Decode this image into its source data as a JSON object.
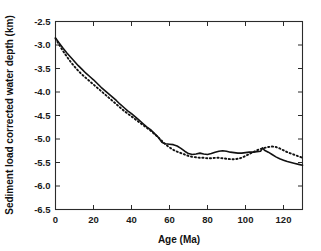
{
  "chart_data": {
    "type": "line",
    "title": "",
    "xlabel": "Age (Ma)",
    "ylabel": "Sediment load corrected water depth (km)",
    "xlim": [
      0,
      130
    ],
    "ylim": [
      -6.5,
      -2.5
    ],
    "grid": false,
    "legend": "none",
    "xticks": [
      0,
      20,
      40,
      60,
      80,
      100,
      120
    ],
    "xtick_labels": [
      "0",
      "20",
      "40",
      "60",
      "80",
      "100",
      "120"
    ],
    "yticks": [
      -2.5,
      -3.0,
      -3.5,
      -4.0,
      -4.5,
      -5.0,
      -5.5,
      -6.0,
      -6.5
    ],
    "ytick_labels": [
      "-2.5",
      "-3.0",
      "-3.5",
      "-4.0",
      "-4.5",
      "-5.0",
      "-5.5",
      "-6.0",
      "-6.5"
    ],
    "series": [
      {
        "name": "solid-curve",
        "style": "solid",
        "color": "#121212",
        "x": [
          0,
          2,
          4,
          6,
          8,
          10,
          12,
          14,
          16,
          18,
          20,
          22,
          24,
          26,
          28,
          30,
          32,
          34,
          36,
          38,
          40,
          42,
          44,
          46,
          48,
          50,
          52,
          54,
          56,
          57,
          58,
          60,
          62,
          64,
          66,
          68,
          70,
          72,
          74,
          76,
          78,
          80,
          82,
          84,
          86,
          88,
          90,
          92,
          94,
          96,
          98,
          100,
          102,
          104,
          106,
          108,
          109,
          110,
          111,
          112,
          114,
          116,
          118,
          120,
          122,
          124,
          126,
          128,
          130
        ],
        "y": [
          -2.85,
          -2.96,
          -3.07,
          -3.17,
          -3.26,
          -3.35,
          -3.44,
          -3.52,
          -3.6,
          -3.67,
          -3.74,
          -3.82,
          -3.9,
          -3.97,
          -4.04,
          -4.11,
          -4.18,
          -4.26,
          -4.33,
          -4.4,
          -4.46,
          -4.53,
          -4.6,
          -4.67,
          -4.74,
          -4.8,
          -4.88,
          -4.96,
          -5.07,
          -5.09,
          -5.1,
          -5.11,
          -5.12,
          -5.15,
          -5.2,
          -5.26,
          -5.31,
          -5.33,
          -5.32,
          -5.3,
          -5.32,
          -5.33,
          -5.31,
          -5.28,
          -5.26,
          -5.25,
          -5.26,
          -5.28,
          -5.29,
          -5.3,
          -5.3,
          -5.29,
          -5.28,
          -5.28,
          -5.27,
          -5.26,
          -5.19,
          -5.24,
          -5.26,
          -5.28,
          -5.33,
          -5.38,
          -5.42,
          -5.45,
          -5.48,
          -5.5,
          -5.52,
          -5.54,
          -5.56
        ]
      },
      {
        "name": "dotted-curve",
        "style": "dotted",
        "color": "#121212",
        "x": [
          0,
          2,
          4,
          6,
          8,
          10,
          12,
          14,
          16,
          18,
          20,
          22,
          24,
          26,
          28,
          30,
          32,
          34,
          36,
          38,
          40,
          42,
          44,
          46,
          48,
          50,
          52,
          54,
          56,
          58,
          60,
          62,
          64,
          66,
          68,
          70,
          72,
          74,
          76,
          78,
          80,
          82,
          84,
          86,
          88,
          90,
          92,
          94,
          96,
          98,
          100,
          102,
          104,
          106,
          108,
          110,
          112,
          114,
          116,
          118,
          120,
          122,
          124,
          126,
          128,
          130
        ],
        "y": [
          -2.86,
          -3.0,
          -3.13,
          -3.25,
          -3.36,
          -3.46,
          -3.55,
          -3.63,
          -3.7,
          -3.77,
          -3.84,
          -3.91,
          -3.98,
          -4.05,
          -4.12,
          -4.19,
          -4.26,
          -4.33,
          -4.4,
          -4.46,
          -4.52,
          -4.58,
          -4.64,
          -4.7,
          -4.76,
          -4.82,
          -4.89,
          -4.96,
          -5.04,
          -5.12,
          -5.18,
          -5.23,
          -5.27,
          -5.3,
          -5.33,
          -5.36,
          -5.38,
          -5.39,
          -5.4,
          -5.4,
          -5.41,
          -5.41,
          -5.4,
          -5.4,
          -5.41,
          -5.42,
          -5.43,
          -5.43,
          -5.42,
          -5.4,
          -5.36,
          -5.32,
          -5.28,
          -5.24,
          -5.21,
          -5.19,
          -5.17,
          -5.16,
          -5.17,
          -5.2,
          -5.24,
          -5.28,
          -5.31,
          -5.34,
          -5.37,
          -5.4
        ]
      }
    ]
  },
  "axes": {
    "x_axis_title": "Age (Ma)",
    "y_axis_title": "Sediment load corrected water depth (km)"
  }
}
